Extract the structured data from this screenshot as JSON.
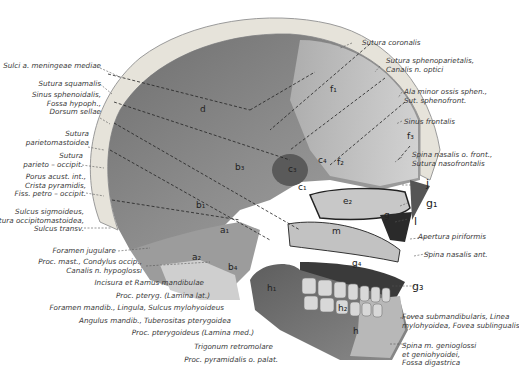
{
  "figure": {
    "colors": {
      "background": "#ffffff",
      "bone_dark": "#6b6b6b",
      "bone_mid": "#9a9a9a",
      "bone_light": "#d6d6d6",
      "cortex": "#e4e2dc",
      "label_text": "#3a3a3a"
    }
  },
  "left_labels": [
    {
      "id": "sulci-meningeae",
      "lines": [
        "Sulci a. meningeae mediae"
      ]
    },
    {
      "id": "sutura-squamalis",
      "lines": [
        "Sutura squamalis"
      ]
    },
    {
      "id": "sinus-sphenoidalis",
      "lines": [
        "Sinus sphenoidalis,",
        "Fossa hypoph.,",
        "Dorsum sellae"
      ]
    },
    {
      "id": "sutura-parietomastoidea",
      "lines": [
        "Sutura",
        "parietomastoidea"
      ]
    },
    {
      "id": "sutura-parieto-occipit",
      "lines": [
        "Sutura",
        "parieto – occipit."
      ]
    },
    {
      "id": "porus-acust",
      "lines": [
        "Porus acust. int.,",
        "Crista pyramidis,",
        "Fiss. petro – occipit."
      ]
    },
    {
      "id": "sulcus-sigmoideus",
      "lines": [
        "Sulcus sigmoideus,",
        "Sutura occipitomastoidea,",
        "Sulcus transv."
      ]
    },
    {
      "id": "foramen-jugulare",
      "lines": [
        "Foramen jugulare"
      ]
    },
    {
      "id": "proc-mast",
      "lines": [
        "Proc. mast., Condylus occip.,",
        "Canalis n. hypoglossi"
      ]
    }
  ],
  "bottom_labels": [
    {
      "id": "incisura-ramus",
      "text": "Incisura et Ramus mandibulae"
    },
    {
      "id": "proc-pteryg-lat",
      "text": "Proc. pteryg. (Lamina lat.)"
    },
    {
      "id": "foramen-mandib",
      "text": "Foramen mandib., Lingula, Sulcus mylohyoideus"
    },
    {
      "id": "angulus-mandib",
      "text": "Angulus mandib., Tuberositas pterygoidea"
    },
    {
      "id": "proc-pteryg-med",
      "text": "Proc. pterygoideus (Lamina med.)"
    },
    {
      "id": "trigonum",
      "text": "Trigonum retromolare"
    },
    {
      "id": "proc-pyramidalis",
      "text": "Proc. pyramidalis o. palat."
    }
  ],
  "right_labels": [
    {
      "id": "sutura-coronalis",
      "lines": [
        "Sutura coronalis"
      ]
    },
    {
      "id": "sutura-sphenoparietalis",
      "lines": [
        "Sutura sphenoparietalis,",
        "Canalis n. optici"
      ]
    },
    {
      "id": "ala-minor",
      "lines": [
        "Ala minor ossis sphen.,",
        "Sut. sphenofront."
      ]
    },
    {
      "id": "sinus-frontalis",
      "lines": [
        "Sinus frontalis"
      ]
    },
    {
      "id": "spina-nasalis-front",
      "lines": [
        "Spina nasalis o. front.,",
        "Sutura nasofrontalis"
      ]
    },
    {
      "id": "apertura-piriformis",
      "lines": [
        "Apertura piriformis"
      ]
    },
    {
      "id": "spina-nasalis-ant",
      "lines": [
        "Spina nasalis ant."
      ]
    },
    {
      "id": "fovea-submandibularis",
      "lines": [
        "Fovea submandibularis, Linea",
        "mylohyoidea, Fovea sublingualis"
      ]
    },
    {
      "id": "spina-genioglossi",
      "lines": [
        "Spina m. genioglossi",
        "et geniohyoidei,",
        "Fossa digastrica"
      ]
    }
  ],
  "right_letters": [
    {
      "id": "j",
      "text": "j"
    },
    {
      "id": "g1",
      "text": "g₁"
    },
    {
      "id": "l",
      "text": "l"
    },
    {
      "id": "g3",
      "text": "g₃"
    },
    {
      "id": "f3",
      "text": "f₃"
    }
  ],
  "region_letters": [
    {
      "id": "d",
      "text": "d"
    },
    {
      "id": "f1",
      "text": "f₁"
    },
    {
      "id": "f2",
      "text": "f₂"
    },
    {
      "id": "b3",
      "text": "b₃"
    },
    {
      "id": "c3",
      "text": "c₃"
    },
    {
      "id": "c4",
      "text": "c₄"
    },
    {
      "id": "c1",
      "text": "c₁"
    },
    {
      "id": "b1",
      "text": "b₁"
    },
    {
      "id": "a1",
      "text": "a₁"
    },
    {
      "id": "a2",
      "text": "a₂"
    },
    {
      "id": "b4",
      "text": "b₄"
    },
    {
      "id": "e2",
      "text": "e₂"
    },
    {
      "id": "g",
      "text": "g"
    },
    {
      "id": "m",
      "text": "m"
    },
    {
      "id": "h1",
      "text": "h₁"
    },
    {
      "id": "g4",
      "text": "g₄"
    },
    {
      "id": "h2",
      "text": "h₂"
    },
    {
      "id": "h",
      "text": "h"
    }
  ]
}
